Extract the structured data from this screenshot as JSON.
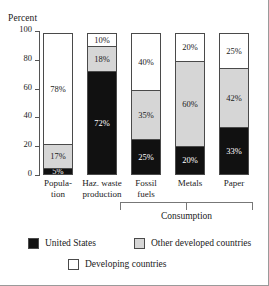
{
  "chart_data": {
    "type": "bar",
    "subtype": "stacked-100",
    "title": "",
    "xlabel": "",
    "ylabel": "Percent",
    "ylim": [
      0,
      100
    ],
    "yticks": [
      0,
      20,
      40,
      60,
      80,
      100
    ],
    "ytick_labels": [
      "0",
      "20",
      "40",
      "60",
      "80",
      "100"
    ],
    "grid": false,
    "legend_position": "bottom",
    "categories": [
      "Popula-\ntion",
      "Haz. waste\nproduction",
      "Fossil\nfuels",
      "Metals",
      "Paper"
    ],
    "series": [
      {
        "name": "United States",
        "color": "#111111",
        "values": [
          5,
          72,
          25,
          20,
          33
        ],
        "labels": [
          "5%",
          "72%",
          "25%",
          "20%",
          "33%"
        ]
      },
      {
        "name": "Other developed countries",
        "color": "#d6d6d6",
        "values": [
          17,
          18,
          35,
          60,
          42
        ],
        "labels": [
          "17%",
          "18%",
          "35%",
          "60%",
          "42%"
        ]
      },
      {
        "name": "Developing countries",
        "color": "#ffffff",
        "values": [
          78,
          10,
          40,
          20,
          25
        ],
        "labels": [
          "78%",
          "10%",
          "40%",
          "20%",
          "25%"
        ]
      }
    ],
    "annotations": [
      {
        "name": "consumption-bracket",
        "text": "Consumption",
        "spans": [
          "Fossil\nfuels",
          "Metals",
          "Paper"
        ]
      }
    ]
  },
  "axis": {
    "title": "Percent",
    "ticks": [
      {
        "label": "100",
        "value": 100
      },
      {
        "label": "80",
        "value": 80
      },
      {
        "label": "60",
        "value": 60
      },
      {
        "label": "40",
        "value": 40
      },
      {
        "label": "20",
        "value": 20
      },
      {
        "label": "0",
        "value": 0
      }
    ]
  },
  "bars": [
    {
      "key": "population",
      "label_line1": "Popula-",
      "label_line2": "tion",
      "us": 5,
      "us_label": "5%",
      "other": 17,
      "other_label": "17%",
      "developing": 78,
      "developing_label": "78%"
    },
    {
      "key": "haz-waste-production",
      "label_line1": "Haz. waste",
      "label_line2": "production",
      "us": 72,
      "us_label": "72%",
      "other": 18,
      "other_label": "18%",
      "developing": 10,
      "developing_label": "10%"
    },
    {
      "key": "fossil-fuels",
      "label_line1": "Fossil",
      "label_line2": "fuels",
      "us": 25,
      "us_label": "25%",
      "other": 35,
      "other_label": "35%",
      "developing": 40,
      "developing_label": "40%"
    },
    {
      "key": "metals",
      "label_line1": "Metals",
      "label_line2": "",
      "us": 20,
      "us_label": "20%",
      "other": 60,
      "other_label": "60%",
      "developing": 20,
      "developing_label": "20%"
    },
    {
      "key": "paper",
      "label_line1": "Paper",
      "label_line2": "",
      "us": 33,
      "us_label": "33%",
      "other": 42,
      "other_label": "42%",
      "developing": 25,
      "developing_label": "25%"
    }
  ],
  "bracket": {
    "label": "Consumption"
  },
  "legend": {
    "united_states": "United States",
    "other_developed": "Other developed countries",
    "developing": "Developing countries"
  },
  "colors": {
    "united_states": "#111111",
    "other_developed": "#d6d6d6",
    "developing": "#ffffff",
    "outline": "#4a4a4a",
    "axis": "#555555",
    "bracket": "#777777",
    "frame": "#9a9a9a"
  }
}
